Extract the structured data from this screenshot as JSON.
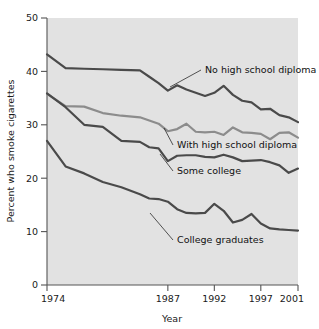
{
  "chart_data": {
    "type": "line",
    "title": "",
    "xlabel": "Year",
    "ylabel": "Percent who smoke cigarettes",
    "xlim": [
      1974,
      2001
    ],
    "ylim": [
      0,
      50
    ],
    "xticks": [
      1974,
      1987,
      1992,
      1997,
      2001
    ],
    "xtick_labels": [
      "1974",
      "1987",
      "1992",
      "1997",
      "2001"
    ],
    "yticks": [
      0,
      10,
      20,
      30,
      40,
      50
    ],
    "ytick_labels": [
      "0",
      "10",
      "20",
      "30",
      "40",
      "50"
    ],
    "grid": false,
    "legend_position": "inline-annotations",
    "x": [
      1974,
      1976,
      1978,
      1980,
      1982,
      1984,
      1985,
      1986,
      1987,
      1988,
      1989,
      1990,
      1991,
      1992,
      1993,
      1994,
      1995,
      1996,
      1997,
      1998,
      1999,
      2000,
      2001
    ],
    "series": [
      {
        "name": "No high school diploma",
        "color": "#4a4a4a",
        "values": [
          43.2,
          40.6,
          40.5,
          40.4,
          40.3,
          40.2,
          39.0,
          37.8,
          36.4,
          37.4,
          36.6,
          36.0,
          35.4,
          36.0,
          37.3,
          35.6,
          34.5,
          34.2,
          32.9,
          33.0,
          31.8,
          31.4,
          30.5
        ]
      },
      {
        "name": "With high school diploma",
        "color": "#8c8c8c",
        "values": [
          35.8,
          33.5,
          33.4,
          32.2,
          31.7,
          31.4,
          30.8,
          30.2,
          28.8,
          29.2,
          30.2,
          28.7,
          28.6,
          28.7,
          28.1,
          29.5,
          28.6,
          28.5,
          28.3,
          27.3,
          28.5,
          28.6,
          27.6
        ]
      },
      {
        "name": "Some college",
        "color": "#4a4a4a",
        "values": [
          35.9,
          33.3,
          30.0,
          29.6,
          27.0,
          26.8,
          25.8,
          25.6,
          23.2,
          24.2,
          24.3,
          24.3,
          24.0,
          23.9,
          24.4,
          23.9,
          23.2,
          23.3,
          23.4,
          23.0,
          22.4,
          21.0,
          21.8
        ]
      },
      {
        "name": "College graduates",
        "color": "#4a4a4a",
        "values": [
          27.0,
          22.2,
          20.9,
          19.3,
          18.3,
          17.0,
          16.2,
          16.1,
          15.6,
          14.2,
          13.5,
          13.4,
          13.5,
          15.2,
          13.9,
          11.7,
          12.2,
          13.3,
          11.5,
          10.6,
          10.4,
          10.3,
          10.2
        ]
      }
    ],
    "annotations": [
      {
        "text": "No high school diploma",
        "series": "No high school diploma"
      },
      {
        "text": "With high school diploma",
        "series": "With high school diploma"
      },
      {
        "text": "Some college",
        "series": "Some college"
      },
      {
        "text": "College graduates",
        "series": "College graduates"
      }
    ]
  },
  "colors": {
    "plot_background": "#e2e2e2",
    "page_background": "#ffffff",
    "axis": "#555555",
    "dark_series": "#4a4a4a",
    "light_series": "#8c8c8c",
    "text": "#1a1a1a"
  }
}
